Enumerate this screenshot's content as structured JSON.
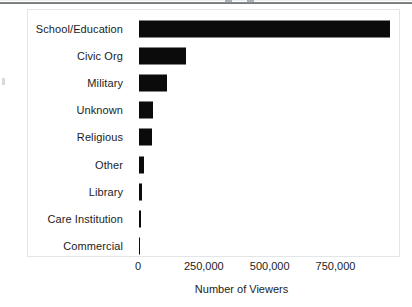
{
  "figure": {
    "background_color": "#ffffff",
    "panel_border_color": "#e3e5e6",
    "bar_color": "#0b0b0b",
    "text_color": "#1c1c1c"
  },
  "axis": {
    "x_label": "Number of Viewers",
    "x_ticks": [
      "0",
      "250,000",
      "500,000",
      "750,000"
    ],
    "x_tick_values": [
      0,
      250000,
      500000,
      750000
    ]
  },
  "chart_data": {
    "type": "bar",
    "orientation": "horizontal",
    "title": "",
    "subtitle": "",
    "xlabel": "Number of Viewers",
    "ylabel": "",
    "categories": [
      "School/Education",
      "Civic Org",
      "Military",
      "Unknown",
      "Religious",
      "Other",
      "Library",
      "Care Institution",
      "Commercial"
    ],
    "values": [
      955000,
      178000,
      106000,
      53000,
      49000,
      19000,
      9500,
      6000,
      5000
    ],
    "xlim": [
      0,
      995000
    ],
    "xticks": [
      0,
      250000,
      500000,
      750000
    ],
    "xticklabels": [
      "0",
      "250,000",
      "500,000",
      "750,000"
    ],
    "grid": false,
    "legend": null,
    "bar_color": "#0b0b0b"
  }
}
